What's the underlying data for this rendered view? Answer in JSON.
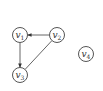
{
  "graph": {
    "type": "directed-graph",
    "nodes": [
      {
        "id": "v1",
        "base": "v",
        "sub": "1",
        "cx": 20,
        "cy": 35
      },
      {
        "id": "v2",
        "base": "v",
        "sub": "2",
        "cx": 57,
        "cy": 35
      },
      {
        "id": "v3",
        "base": "v",
        "sub": "3",
        "cx": 20,
        "cy": 75
      },
      {
        "id": "v4",
        "base": "v",
        "sub": "4",
        "cx": 86,
        "cy": 54
      }
    ],
    "edges": [
      {
        "from": "v2",
        "to": "v1",
        "directed": true
      },
      {
        "from": "v1",
        "to": "v3",
        "directed": true
      },
      {
        "from": "v2",
        "to": "v3",
        "directed": false
      }
    ]
  }
}
